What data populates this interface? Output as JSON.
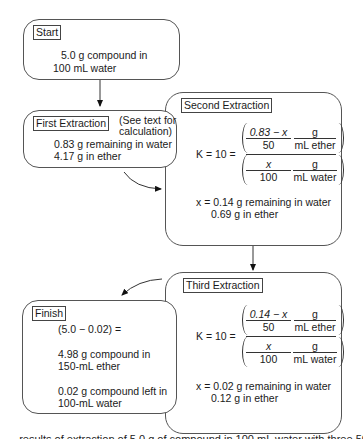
{
  "start": {
    "label": "Start",
    "line1": "5.0 g compound in",
    "line2": "100 mL water"
  },
  "first": {
    "label": "First Extraction",
    "note1": "(See text for",
    "note2": "calculation)",
    "line1": "0.83 g remaining in water",
    "line2": "4.17 g in ether"
  },
  "second": {
    "label": "Second Extraction",
    "k_label": "K = 10 =",
    "top_num": "0.83 − x",
    "top_den": "50",
    "unit_top_num": "g",
    "unit_top_den": "mL ether",
    "bot_num": "x",
    "bot_den": "100",
    "unit_bot_num": "g",
    "unit_bot_den": "mL water",
    "result1": "x = 0.14 g remaining in water",
    "result2": "0.69 g in ether"
  },
  "third": {
    "label": "Third Extraction",
    "k_label": "K = 10 =",
    "top_num": "0.14 − x",
    "top_den": "50",
    "unit_top_num": "g",
    "unit_top_den": "mL ether",
    "bot_num": "x",
    "bot_den": "100",
    "unit_bot_num": "g",
    "unit_bot_den": "mL water",
    "result1": "x = 0.02 g remaining in water",
    "result2": "0.12 g in ether"
  },
  "finish": {
    "label": "Finish",
    "line1": "(5.0 − 0.02) =",
    "line2": "4.98 g compound in",
    "line3": "150-mL ether",
    "line4": "0.02 g compound left in",
    "line5": "100-mL water"
  },
  "caption": {
    "text": "...results of extraction of 5.0 g of compound in 100 mL water with three 50-mL portions of ether"
  }
}
